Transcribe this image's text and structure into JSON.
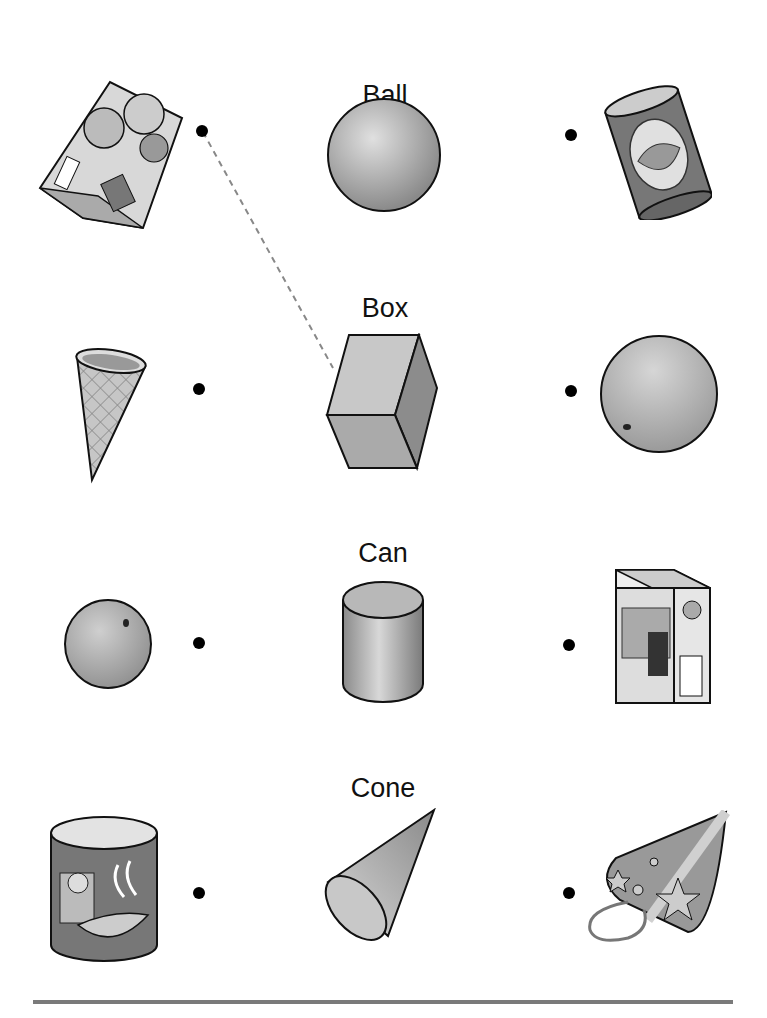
{
  "worksheet": {
    "rows": [
      {
        "shape_label": "Ball",
        "shape": "sphere",
        "left_item": "cracker-box",
        "right_item": "spaghetti-can"
      },
      {
        "shape_label": "Box",
        "shape": "cube",
        "left_item": "ice-cream-cone",
        "right_item": "orange"
      },
      {
        "shape_label": "Can",
        "shape": "cylinder",
        "left_item": "orange",
        "right_item": "cake-mix-box"
      },
      {
        "shape_label": "Cone",
        "shape": "cone",
        "left_item": "oatmeal-can",
        "right_item": "party-hat"
      }
    ],
    "example_connection": {
      "from": "cracker-box-dot",
      "to": "box-shape",
      "style": "dashed"
    },
    "colors": {
      "ink": "#111111",
      "shape_fill": "#bdbdbd",
      "rule": "#7a7a7a",
      "dashed_line": "#888888"
    }
  }
}
